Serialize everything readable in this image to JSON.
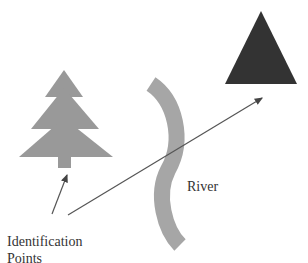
{
  "diagram": {
    "labels": {
      "river": "River",
      "identification_line1": "Identification",
      "identification_line2": "Points",
      "clipped_top": ""
    },
    "shapes": {
      "tree": {
        "color": "#999999",
        "role": "identification-point"
      },
      "river": {
        "color": "#a6a6a6"
      },
      "triangle": {
        "color": "#333333",
        "role": "identification-point"
      }
    },
    "arrows": [
      {
        "from": "Identification Points",
        "to": "tree"
      },
      {
        "from": "Identification Points",
        "to": "triangle"
      }
    ]
  }
}
